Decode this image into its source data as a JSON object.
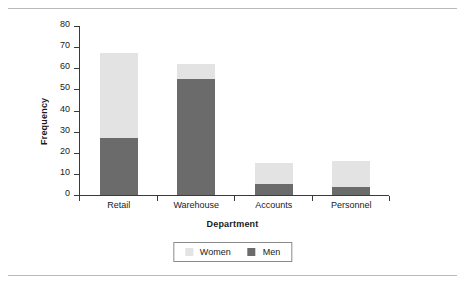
{
  "chart_data": {
    "type": "bar",
    "subtype": "stacked-bar",
    "title": "",
    "xlabel": "Department",
    "ylabel": "Frequency",
    "categories": [
      "Retail",
      "Warehouse",
      "Accounts",
      "Personnel"
    ],
    "series": [
      {
        "name": "Men",
        "color": "#6b6b6b",
        "values": [
          27,
          55,
          5,
          4
        ]
      },
      {
        "name": "Women",
        "color": "#e3e3e3",
        "values": [
          40,
          7,
          10,
          12
        ]
      }
    ],
    "stack_order": [
      "Men",
      "Women"
    ],
    "totals": [
      67,
      62,
      15,
      16
    ],
    "ylim": [
      0,
      80
    ],
    "ytick_step": 10,
    "yticks": [
      0,
      10,
      20,
      30,
      40,
      50,
      60,
      70,
      80
    ],
    "ytick_labels": [
      "0",
      "10",
      "20",
      "30",
      "40",
      "50",
      "60",
      "70",
      "80"
    ],
    "grid": false,
    "legend_position": "bottom",
    "legend_entries": [
      "Women",
      "Men"
    ]
  },
  "figure": {
    "rule_color": "#b9b9b9",
    "axis_color": "#3a3a3a",
    "background": "#ffffff"
  }
}
